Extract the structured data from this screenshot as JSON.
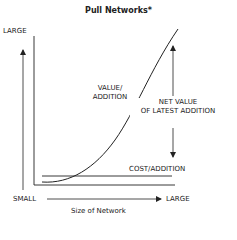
{
  "title": "Pull Networks*",
  "y_axis": {
    "top_label": "LARGE"
  },
  "x_axis": {
    "left_label": "SMALL",
    "right_label": "LARGE",
    "title": "Size of Network"
  },
  "curves": {
    "value_label_line1": "VALUE/",
    "value_label_line2": "ADDITION",
    "cost_label": "COST/ADDITION"
  },
  "annotation": {
    "line1": "NET VALUE",
    "line2": "OF LATEST ADDITION"
  },
  "colors": {
    "ink": "#222222",
    "background": "#ffffff"
  }
}
